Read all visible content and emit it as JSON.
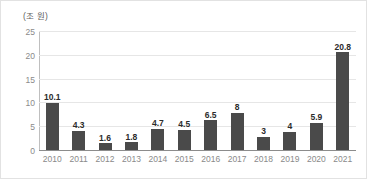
{
  "chart_data": {
    "type": "bar",
    "title": "",
    "subtitle": "",
    "unit_label": "(조 원)",
    "xlabel": "",
    "ylabel": "",
    "categories": [
      "2010",
      "2011",
      "2012",
      "2013",
      "2014",
      "2015",
      "2016",
      "2017",
      "2018",
      "2019",
      "2020",
      "2021"
    ],
    "values": [
      10.1,
      4.3,
      1.6,
      1.8,
      4.7,
      4.5,
      6.5,
      8,
      3,
      4,
      5.9,
      20.8
    ],
    "value_labels": [
      "10.1",
      "4.3",
      "1.6",
      "1.8",
      "4.7",
      "4.5",
      "6.5",
      "8",
      "3",
      "4",
      "5.9",
      "20.8"
    ],
    "ylim": [
      0,
      25
    ],
    "ytick_values": [
      0,
      5,
      10,
      15,
      20,
      25
    ],
    "ytick_labels": [
      "0",
      "5",
      "10",
      "15",
      "20",
      "25"
    ],
    "grid": true,
    "legend": false,
    "bar_color": "#4a4a4a",
    "gridline_color": "#e6e6e6",
    "axis_color": "#8c8c8c",
    "tick_label_color": "#8a8a8a",
    "value_label_color": "#2b2b2b"
  }
}
